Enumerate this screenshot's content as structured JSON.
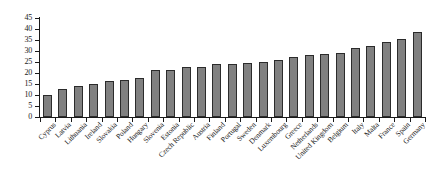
{
  "chart_data": {
    "type": "bar",
    "title": "",
    "subtitle": "",
    "xlabel": "",
    "ylabel": "",
    "ylim": [
      0,
      45
    ],
    "yticks": [
      0,
      5,
      10,
      15,
      20,
      25,
      30,
      35,
      40,
      45
    ],
    "grid": false,
    "legend": null,
    "legend_position": "none",
    "bar_color": "#808080",
    "bar_edge_color": "#2b2b2b",
    "axis_color": "#1a1a1a",
    "categories": [
      "Cyprus",
      "Latvia",
      "Lithuania",
      "Ireland",
      "Slovakia",
      "Poland",
      "Hungary",
      "Slovenia",
      "Estonia",
      "Czech Republic",
      "Austria",
      "Finland",
      "Portugal",
      "Sweden",
      "Denmark",
      "Luxembourg",
      "Greece",
      "Netherlands",
      "United Kingdom",
      "Belgium",
      "Italy",
      "Malta",
      "France",
      "Spain",
      "Germany"
    ],
    "values": [
      10.0,
      12.8,
      14.3,
      14.8,
      16.3,
      16.8,
      17.8,
      21.5,
      21.5,
      22.7,
      22.8,
      24.2,
      24.3,
      24.5,
      24.8,
      26.0,
      27.5,
      28.0,
      28.5,
      29.3,
      31.3,
      32.3,
      34.0,
      35.5,
      38.5
    ]
  }
}
